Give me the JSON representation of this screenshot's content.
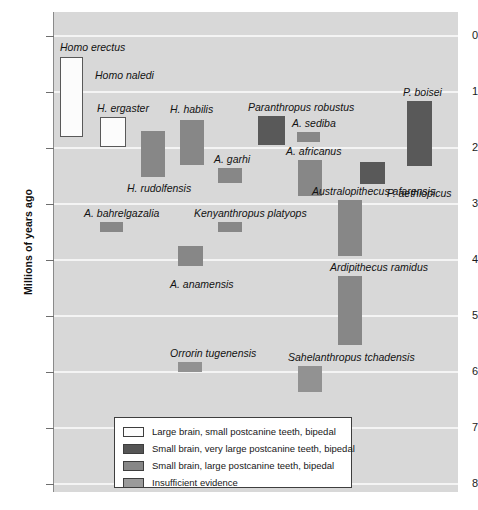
{
  "chart_data": {
    "type": "bar",
    "title": "",
    "subtitle": "",
    "xlabel": "",
    "ylabel": "Millions of years ago",
    "ylim": [
      0,
      8.6
    ],
    "y_axis_inverted": true,
    "grid": true,
    "legend_position": "bottom-left",
    "y_ticks": [
      {
        "label": "0",
        "value": 0
      },
      {
        "label": "1",
        "value": 1
      },
      {
        "label": "2",
        "value": 2
      },
      {
        "label": "3",
        "value": 3
      },
      {
        "label": "4",
        "value": 4
      },
      {
        "label": "5",
        "value": 5
      },
      {
        "label": "6",
        "value": 6
      },
      {
        "label": "7",
        "value": 7
      },
      {
        "label": "8",
        "value": 8
      }
    ],
    "categories": [
      "Homo erectus",
      "Homo naledi",
      "H. ergaster",
      "H. rudolfensis",
      "H. habilis",
      "A. garhi",
      "Paranthropus robustus",
      "A. sediba",
      "A. africanus",
      "P. aethiopicus",
      "P. boisei",
      "A. bahrelgazalia",
      "Kenyanthropus platyops",
      "A. anamensis",
      "Australopithecus afarensis",
      "Ardipithecus ramidus",
      "Orrorin tugenensis",
      "Sahelanthropus tchadensis"
    ],
    "series": [
      {
        "name": "Range of existence (Ma)",
        "ranges": [
          {
            "species": "Homo erectus",
            "start": 0.38,
            "end": 1.81,
            "category": "large-brain"
          },
          {
            "species": "Homo naledi",
            "start": null,
            "end": null,
            "category": "unplotted"
          },
          {
            "species": "H. ergaster",
            "start": 1.45,
            "end": 1.98,
            "category": "large-brain"
          },
          {
            "species": "H. rudolfensis",
            "start": 1.7,
            "end": 2.52,
            "category": "large-teeth"
          },
          {
            "species": "H. habilis",
            "start": 1.5,
            "end": 2.3,
            "category": "large-teeth"
          },
          {
            "species": "A. garhi",
            "start": 2.36,
            "end": 2.63,
            "category": "large-teeth"
          },
          {
            "species": "Paranthropus robustus",
            "start": 1.43,
            "end": 1.95,
            "category": "very-large-teeth"
          },
          {
            "species": "A. sediba",
            "start": 1.71,
            "end": 1.89,
            "category": "large-teeth"
          },
          {
            "species": "A. africanus",
            "start": 2.21,
            "end": 2.86,
            "category": "large-teeth"
          },
          {
            "species": "P. aethiopicus",
            "start": 2.25,
            "end": 2.64,
            "category": "very-large-teeth"
          },
          {
            "species": "P. boisei",
            "start": 1.16,
            "end": 2.32,
            "category": "very-large-teeth"
          },
          {
            "species": "A. bahrelgazalia",
            "start": 3.32,
            "end": 3.5,
            "category": "large-teeth"
          },
          {
            "species": "Kenyanthropus platyops",
            "start": 3.32,
            "end": 3.5,
            "category": "large-teeth"
          },
          {
            "species": "A. anamensis",
            "start": 3.75,
            "end": 4.11,
            "category": "large-teeth"
          },
          {
            "species": "Australopithecus afarensis",
            "start": 2.93,
            "end": 3.93,
            "category": "large-teeth"
          },
          {
            "species": "Ardipithecus ramidus",
            "start": 4.29,
            "end": 5.52,
            "category": "large-teeth"
          },
          {
            "species": "Orrorin tugenensis",
            "start": 5.82,
            "end": 6.0,
            "category": "insufficient"
          },
          {
            "species": "Sahelanthropus tchadensis",
            "start": 5.89,
            "end": 6.36,
            "category": "insufficient"
          }
        ]
      }
    ],
    "annotations": [
      "Homo naledi has a text label but no plotted range bar"
    ]
  },
  "axis": {
    "y_title": "Millions of years ago",
    "ticks": [
      "0",
      "1",
      "2",
      "3",
      "4",
      "5",
      "6",
      "7",
      "8"
    ]
  },
  "bars": [
    {
      "label": "Homo erectus",
      "class": "large-brain",
      "x": 6,
      "y": 45,
      "w": 23,
      "h": 80,
      "label_x": 6,
      "label_y": 30
    },
    {
      "label": "H. ergaster",
      "class": "large-brain",
      "x": 46,
      "y": 105,
      "w": 26,
      "h": 30,
      "label_x": 43,
      "label_y": 91
    },
    {
      "label": "H. rudolfensis",
      "class": "large-teeth",
      "x": 87,
      "y": 119,
      "w": 24,
      "h": 46,
      "label_x": 73,
      "label_y": 171
    },
    {
      "label": "H. habilis",
      "class": "large-teeth",
      "x": 126,
      "y": 108,
      "w": 24,
      "h": 45,
      "label_x": 116,
      "label_y": 92
    },
    {
      "label": "A. garhi",
      "class": "large-teeth",
      "x": 164,
      "y": 156,
      "w": 24,
      "h": 15,
      "label_x": 160,
      "label_y": 142
    },
    {
      "label": "Paranthropus robustus",
      "class": "very-large-teeth",
      "x": 204,
      "y": 104,
      "w": 27,
      "h": 29,
      "label_x": 194,
      "label_y": 90
    },
    {
      "label": "A. sediba",
      "class": "large-teeth",
      "x": 243,
      "y": 120,
      "w": 23,
      "h": 10,
      "label_x": 238,
      "label_y": 106
    },
    {
      "label": "A. africanus",
      "class": "large-teeth",
      "x": 244,
      "y": 148,
      "w": 24,
      "h": 36,
      "label_x": 232,
      "label_y": 134
    },
    {
      "label": "P. aethiopicus",
      "class": "very-large-teeth",
      "x": 306,
      "y": 150,
      "w": 25,
      "h": 22,
      "label_x": 333,
      "label_y": 176
    },
    {
      "label": "P. boisei",
      "class": "very-large-teeth",
      "x": 353,
      "y": 89,
      "w": 25,
      "h": 65,
      "label_x": 349,
      "label_y": 75
    },
    {
      "label": "A. bahrelgazalia",
      "class": "large-teeth",
      "x": 46,
      "y": 210,
      "w": 23,
      "h": 10,
      "label_x": 30,
      "label_y": 196
    },
    {
      "label": "Kenyanthropus platyops",
      "class": "large-teeth",
      "x": 164,
      "y": 210,
      "w": 24,
      "h": 10,
      "label_x": 140,
      "label_y": 196
    },
    {
      "label": "A. anamensis",
      "class": "large-teeth",
      "x": 124,
      "y": 234,
      "w": 25,
      "h": 20,
      "label_x": 116,
      "label_y": 267
    },
    {
      "label": "Australopithecus afarensis",
      "class": "large-teeth",
      "x": 284,
      "y": 188,
      "w": 24,
      "h": 56,
      "label_x": 258,
      "label_y": 174
    },
    {
      "label": "Ardipithecus ramidus",
      "class": "large-teeth",
      "x": 284,
      "y": 264,
      "w": 24,
      "h": 69,
      "label_x": 276,
      "label_y": 250
    },
    {
      "label": "Orrorin tugenensis",
      "class": "insufficient",
      "x": 124,
      "y": 350,
      "w": 24,
      "h": 10,
      "label_x": 116,
      "label_y": 336
    },
    {
      "label": "Sahelanthropus tchadensis",
      "class": "insufficient",
      "x": 244,
      "y": 354,
      "w": 24,
      "h": 26,
      "label_x": 234,
      "label_y": 340
    }
  ],
  "floating_labels": [
    {
      "label": "Homo naledi",
      "x": 41,
      "y": 58
    }
  ],
  "legend": {
    "items": [
      {
        "swatch": "large-brain",
        "text": "Large brain, small postcanine teeth, bipedal"
      },
      {
        "swatch": "very-large-teeth",
        "text": "Small brain, very large postcanine teeth, bipedal"
      },
      {
        "swatch": "large-teeth",
        "text": "Small brain, large postcanine teeth, bipedal"
      },
      {
        "swatch": "insufficient",
        "text": "Insufficient evidence"
      }
    ]
  },
  "colors": {
    "plot_background": "#d8d8d8",
    "gridline": "#f4f4f4",
    "large_brain": "#fcfcfc",
    "very_large_teeth": "#595959",
    "large_teeth": "#878787",
    "insufficient": "#929292",
    "text": "#121212"
  }
}
